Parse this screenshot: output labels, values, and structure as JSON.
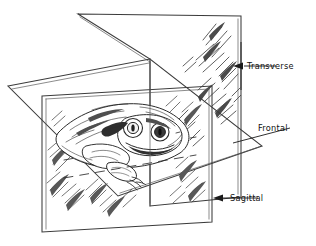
{
  "figure": {
    "background_color": "#ffffff",
    "ink_color": "#2b2b2b",
    "line_color": "#3b3b3b",
    "text_color": "#111111",
    "style": "pen-and-ink line drawing with three intersecting section planes"
  },
  "labels": [
    {
      "id": "transverse",
      "text": "Transverse",
      "plane": "transverse",
      "leader": "vertical line with left-pointing arrow to the rear vertical plane"
    },
    {
      "id": "frontal",
      "text": "Frontal",
      "plane": "frontal",
      "leader": "diagonal line to the right corner of the horizontal plane"
    },
    {
      "id": "sagittal",
      "text": "Sagittal",
      "plane": "sagittal",
      "leader": "horizontal line with left-pointing arrow to the near vertical plane"
    }
  ],
  "planes": [
    {
      "id": "sagittal-plane",
      "name": "sagittal",
      "orientation": "vertical, receding to upper right",
      "description": "rear vertical plane passing left-to-right through the body"
    },
    {
      "id": "transverse-plane",
      "name": "transverse",
      "orientation": "vertical, front facing",
      "description": "near vertical plane containing the frog illustration"
    },
    {
      "id": "frontal-plane",
      "name": "frontal",
      "orientation": "horizontal",
      "description": "horizontal plane cutting the body top from bottom"
    }
  ],
  "illustration": {
    "subject_label": "frog",
    "description": "stippled and hatched rendering of a frog facing right, shown bisected by the planes"
  }
}
